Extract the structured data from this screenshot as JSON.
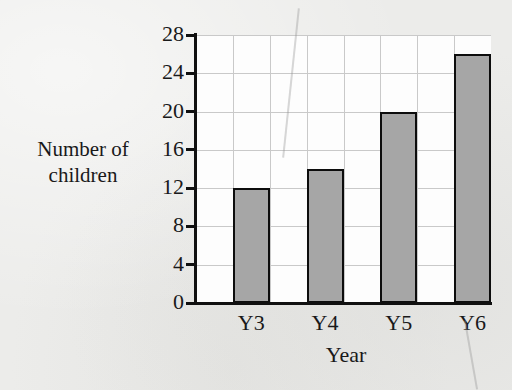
{
  "chart_data": {
    "type": "bar",
    "title": "",
    "categories": [
      "Y3",
      "Y4",
      "Y5",
      "Y6"
    ],
    "values": [
      12,
      14,
      20,
      26
    ],
    "xlabel": "Year",
    "ylabel": "Number of children",
    "ylim": [
      0,
      28
    ],
    "ytick_step": 4,
    "yticks": [
      0,
      4,
      8,
      12,
      16,
      20,
      24,
      28
    ],
    "ytick_labels": [
      "0",
      "4",
      "8",
      "12",
      "16",
      "20",
      "24",
      "28"
    ],
    "grid": true,
    "legend": "none",
    "bar_fill_color": "#a6a6a6",
    "bar_edge_color": "#0d0d0d",
    "background_color": "#ececea",
    "plot_background_color": "#fdfdfd",
    "gridline_color": "#c9c9c9"
  },
  "axis": {
    "y_title_line1": "Number of",
    "y_title_line2": "children",
    "x_title": "Year"
  }
}
